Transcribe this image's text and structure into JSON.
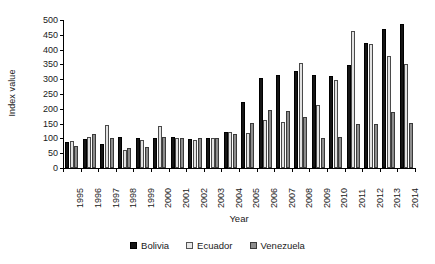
{
  "chart_data": {
    "type": "bar",
    "title": "",
    "xlabel": "Year",
    "ylabel": "Index value",
    "ylim": [
      0,
      500
    ],
    "ytick_step": 50,
    "yticks": [
      0,
      50,
      100,
      150,
      200,
      250,
      300,
      350,
      400,
      450,
      500
    ],
    "grid": false,
    "legend_position": "bottom-center",
    "categories": [
      "1995",
      "1996",
      "1997",
      "1998",
      "1999",
      "2000",
      "2001",
      "2002",
      "2003",
      "2004",
      "2005",
      "2006",
      "2007",
      "2008",
      "2009",
      "2010",
      "2011",
      "2012",
      "2013",
      "2014"
    ],
    "series": [
      {
        "name": "Bolivia",
        "color": "#151515",
        "values": [
          88,
          98,
          82,
          105,
          103,
          103,
          104,
          97,
          100,
          120,
          224,
          305,
          313,
          327,
          313,
          312,
          349,
          424,
          470,
          485
        ]
      },
      {
        "name": "Ecuador",
        "color": "#e2e2e2",
        "values": [
          92,
          106,
          147,
          62,
          93,
          141,
          101,
          94,
          100,
          122,
          118,
          161,
          156,
          354,
          212,
          299,
          464,
          418,
          380,
          351
        ]
      },
      {
        "name": "Venezuela",
        "color": "#8d8d8d",
        "values": [
          76,
          114,
          100,
          67,
          70,
          105,
          100,
          102,
          100,
          114,
          151,
          196,
          193,
          173,
          103,
          104,
          150,
          150,
          189,
          153
        ]
      }
    ]
  },
  "legend": {
    "items": [
      {
        "label": "Bolivia"
      },
      {
        "label": "Ecuador"
      },
      {
        "label": "Venezuela"
      }
    ]
  }
}
